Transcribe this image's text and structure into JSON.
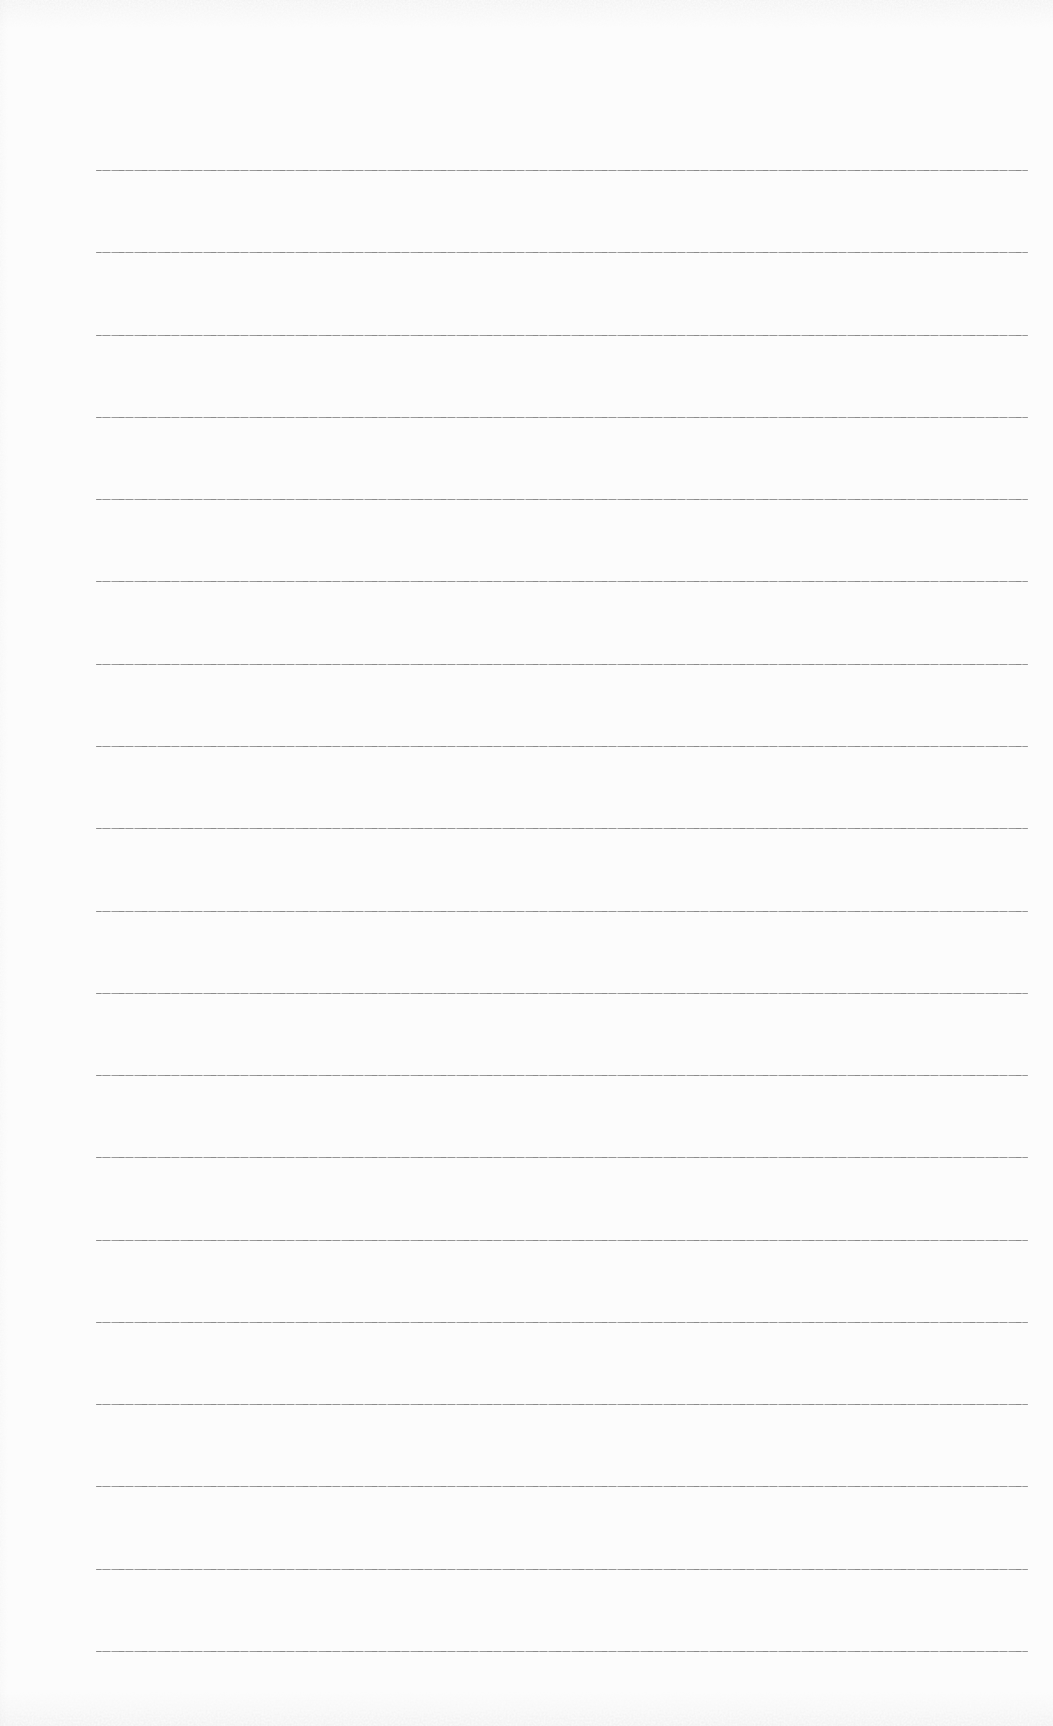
{
  "page": {
    "type": "scanned blank lined notebook page",
    "background_color": "#fcfcfc",
    "rule_color": "#8a8a8a",
    "noise_color": "#bfbfbf"
  },
  "lines": {
    "count": 19,
    "x_start": 96,
    "x_end": 1028,
    "y_positions": [
      170,
      252,
      335,
      417,
      499,
      581,
      664,
      746,
      828,
      911,
      993,
      1075,
      1157,
      1240,
      1322,
      1404,
      1486,
      1569,
      1651
    ]
  }
}
